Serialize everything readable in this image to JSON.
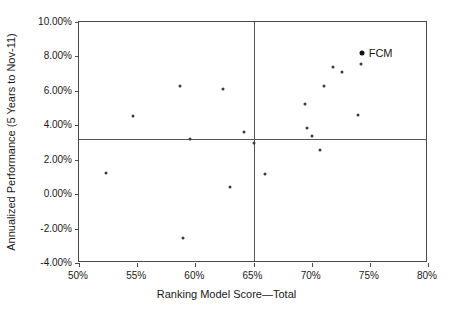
{
  "chart_data": {
    "type": "scatter",
    "title": "",
    "xlabel": "Ranking Model Score—Total",
    "ylabel": "Annualized Performance (5 Years to Nov-11)",
    "xlim": [
      50,
      80
    ],
    "ylim": [
      -4,
      10
    ],
    "xunit": "%",
    "yunit": "%",
    "grid": false,
    "legend": "none",
    "xticks": [
      50,
      55,
      60,
      65,
      70,
      75,
      80
    ],
    "xtick_labels": [
      "50%",
      "55%",
      "60%",
      "65%",
      "70%",
      "75%",
      "80%"
    ],
    "yticks": [
      -4,
      -2,
      0,
      2,
      4,
      6,
      8,
      10
    ],
    "ytick_labels": [
      "-4.00%",
      "-2.00%",
      "0.00%",
      "2.00%",
      "4.00%",
      "6.00%",
      "8.00%",
      "10.00%"
    ],
    "reference_lines": [
      {
        "orientation": "horizontal",
        "value": 3.2,
        "label": "median-performance"
      },
      {
        "orientation": "vertical",
        "value": 65.0,
        "label": "median-score"
      }
    ],
    "series": [
      {
        "name": "Managers",
        "marker": "dot",
        "color": "#3c3c3c",
        "points": [
          {
            "x": 52.3,
            "y": 1.23,
            "label": ""
          },
          {
            "x": 54.6,
            "y": 4.52,
            "label": ""
          },
          {
            "x": 58.7,
            "y": 6.26,
            "label": ""
          },
          {
            "x": 59.5,
            "y": 3.23,
            "label": ""
          },
          {
            "x": 58.9,
            "y": -2.52,
            "label": ""
          },
          {
            "x": 62.4,
            "y": 6.11,
            "label": ""
          },
          {
            "x": 63.0,
            "y": 0.41,
            "label": ""
          },
          {
            "x": 64.2,
            "y": 3.63,
            "label": ""
          },
          {
            "x": 65.0,
            "y": 2.97,
            "label": ""
          },
          {
            "x": 66.0,
            "y": 1.17,
            "label": ""
          },
          {
            "x": 69.4,
            "y": 5.21,
            "label": ""
          },
          {
            "x": 69.6,
            "y": 3.82,
            "label": ""
          },
          {
            "x": 70.0,
            "y": 3.37,
            "label": ""
          },
          {
            "x": 70.7,
            "y": 2.56,
            "label": ""
          },
          {
            "x": 71.1,
            "y": 6.26,
            "label": ""
          },
          {
            "x": 71.8,
            "y": 7.41,
            "label": ""
          },
          {
            "x": 72.6,
            "y": 7.1,
            "label": ""
          },
          {
            "x": 74.2,
            "y": 7.54,
            "label": ""
          },
          {
            "x": 74.0,
            "y": 4.59,
            "label": ""
          }
        ]
      },
      {
        "name": "FCM",
        "marker": "dot-large",
        "color": "#111111",
        "points": [
          {
            "x": 74.3,
            "y": 8.2,
            "label": "FCM"
          }
        ]
      }
    ]
  }
}
